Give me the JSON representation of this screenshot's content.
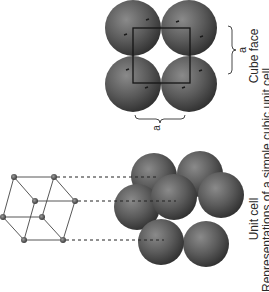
{
  "figure": {
    "panels": [
      {
        "id": "cube-face",
        "label": "Cube face",
        "dimension_label_horizontal": "a",
        "dimension_label_vertical": "a"
      },
      {
        "id": "unit-cell",
        "label": "Unit cell"
      }
    ],
    "caption_partial": "Representations of a simple cubic unit cell",
    "colors": {
      "sphere": "#555555",
      "sphere_highlight": "#8a8a8a",
      "sphere_shadow": "#2a2a2a",
      "lines": "#222222",
      "lattice_point": "#5a5a5a",
      "background": "#ffffff"
    }
  }
}
